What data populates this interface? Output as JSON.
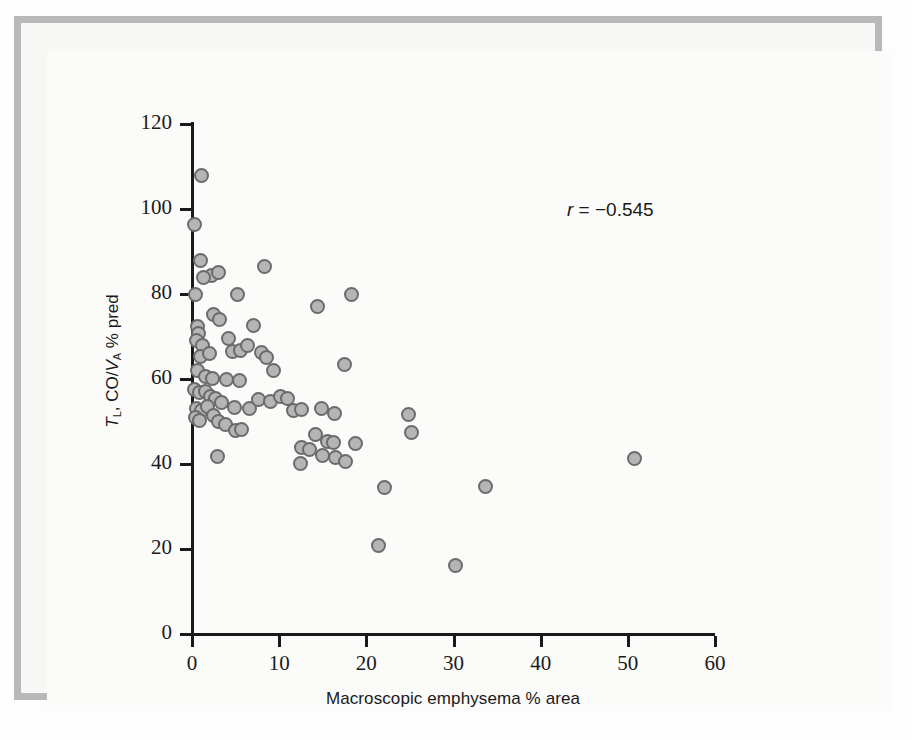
{
  "figure": {
    "background_color": "#fbfbf9",
    "frame_color": "#b8b8b8"
  },
  "annotation": {
    "r_symbol": "r",
    "r_text": " = −0.545",
    "full_text": "r = −0.545"
  },
  "axes": {
    "x_title": "Macroscopic emphysema % area",
    "y_title_prefix": "T",
    "y_title_sub1": "L",
    "y_title_mid": ", CO/",
    "y_title_v": "V",
    "y_title_sub2": "A",
    "y_title_suffix": " % pred",
    "x_ticks": [
      "0",
      "10",
      "20",
      "30",
      "40",
      "50",
      "60"
    ],
    "y_ticks": [
      "120",
      "100",
      "80",
      "60",
      "40",
      "20",
      "0"
    ]
  },
  "chart_data": {
    "type": "scatter",
    "title": "",
    "xlabel": "Macroscopic emphysema % area",
    "ylabel": "T_L,CO/V_A % pred",
    "xlim": [
      0,
      60
    ],
    "ylim": [
      0,
      120
    ],
    "xticks": [
      0,
      10,
      20,
      30,
      40,
      50,
      60
    ],
    "yticks": [
      0,
      20,
      40,
      60,
      80,
      100,
      120
    ],
    "grid": false,
    "legend": false,
    "marker": {
      "shape": "circle",
      "fill_color": "#b5b5b5",
      "edge_color": "#6b6b6b",
      "size_px": 15
    },
    "annotations": [
      {
        "text": "r = −0.545",
        "x": 43.5,
        "y": 96.5
      }
    ],
    "correlation_r": -0.545,
    "n_points": 76,
    "points": [
      {
        "x": 1.1,
        "y": 108.0
      },
      {
        "x": 0.3,
        "y": 96.3
      },
      {
        "x": 1.0,
        "y": 88.0
      },
      {
        "x": 2.2,
        "y": 84.3
      },
      {
        "x": 1.3,
        "y": 83.8
      },
      {
        "x": 3.0,
        "y": 85.0
      },
      {
        "x": 8.3,
        "y": 86.5
      },
      {
        "x": 0.4,
        "y": 80.0
      },
      {
        "x": 2.5,
        "y": 75.2
      },
      {
        "x": 3.2,
        "y": 74.0
      },
      {
        "x": 5.2,
        "y": 80.0
      },
      {
        "x": 0.6,
        "y": 72.3
      },
      {
        "x": 0.8,
        "y": 70.6
      },
      {
        "x": 0.5,
        "y": 69.0
      },
      {
        "x": 1.2,
        "y": 68.0
      },
      {
        "x": 4.2,
        "y": 69.5
      },
      {
        "x": 7.0,
        "y": 72.5
      },
      {
        "x": 14.4,
        "y": 77.0
      },
      {
        "x": 18.3,
        "y": 80.0
      },
      {
        "x": 1.0,
        "y": 65.4
      },
      {
        "x": 2.0,
        "y": 66.0
      },
      {
        "x": 4.6,
        "y": 66.5
      },
      {
        "x": 5.6,
        "y": 66.8
      },
      {
        "x": 6.4,
        "y": 67.8
      },
      {
        "x": 8.0,
        "y": 66.3
      },
      {
        "x": 8.6,
        "y": 65.0
      },
      {
        "x": 0.6,
        "y": 62.0
      },
      {
        "x": 1.6,
        "y": 60.5
      },
      {
        "x": 2.4,
        "y": 60.2
      },
      {
        "x": 4.0,
        "y": 60.0
      },
      {
        "x": 5.4,
        "y": 59.6
      },
      {
        "x": 9.3,
        "y": 62.0
      },
      {
        "x": 17.5,
        "y": 63.5
      },
      {
        "x": 0.3,
        "y": 57.5
      },
      {
        "x": 0.9,
        "y": 56.8
      },
      {
        "x": 1.5,
        "y": 57.0
      },
      {
        "x": 2.1,
        "y": 56.0
      },
      {
        "x": 2.7,
        "y": 55.4
      },
      {
        "x": 3.4,
        "y": 54.4
      },
      {
        "x": 4.9,
        "y": 53.4
      },
      {
        "x": 6.6,
        "y": 53.0
      },
      {
        "x": 7.6,
        "y": 55.2
      },
      {
        "x": 9.0,
        "y": 54.8
      },
      {
        "x": 10.2,
        "y": 56.0
      },
      {
        "x": 11.0,
        "y": 55.4
      },
      {
        "x": 0.5,
        "y": 53.0
      },
      {
        "x": 1.1,
        "y": 52.6
      },
      {
        "x": 1.8,
        "y": 53.5
      },
      {
        "x": 2.5,
        "y": 51.5
      },
      {
        "x": 3.0,
        "y": 50.0
      },
      {
        "x": 3.8,
        "y": 49.3
      },
      {
        "x": 5.0,
        "y": 48.0
      },
      {
        "x": 5.7,
        "y": 48.2
      },
      {
        "x": 0.4,
        "y": 51.0
      },
      {
        "x": 0.9,
        "y": 50.2
      },
      {
        "x": 11.7,
        "y": 52.5
      },
      {
        "x": 12.6,
        "y": 52.8
      },
      {
        "x": 14.8,
        "y": 53.0
      },
      {
        "x": 16.3,
        "y": 52.0
      },
      {
        "x": 24.8,
        "y": 51.7
      },
      {
        "x": 25.2,
        "y": 47.3
      },
      {
        "x": 14.2,
        "y": 47.0
      },
      {
        "x": 15.5,
        "y": 45.3
      },
      {
        "x": 16.2,
        "y": 45.0
      },
      {
        "x": 12.6,
        "y": 43.8
      },
      {
        "x": 13.5,
        "y": 43.5
      },
      {
        "x": 15.0,
        "y": 42.0
      },
      {
        "x": 16.5,
        "y": 41.5
      },
      {
        "x": 17.6,
        "y": 40.5
      },
      {
        "x": 12.5,
        "y": 40.2
      },
      {
        "x": 18.7,
        "y": 44.8
      },
      {
        "x": 2.9,
        "y": 41.8
      },
      {
        "x": 22.1,
        "y": 34.5
      },
      {
        "x": 33.7,
        "y": 34.8
      },
      {
        "x": 50.8,
        "y": 41.3
      },
      {
        "x": 21.4,
        "y": 20.8
      },
      {
        "x": 30.2,
        "y": 16.2
      }
    ]
  }
}
